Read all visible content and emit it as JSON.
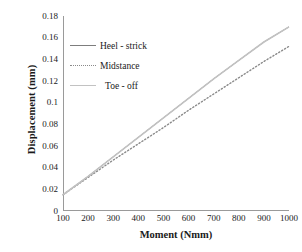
{
  "chart_data": {
    "type": "line",
    "title": "",
    "xlabel": "Moment (Nmm)",
    "ylabel": "Displacement  (mm)",
    "x": [
      100,
      200,
      300,
      400,
      500,
      600,
      700,
      800,
      900,
      1000
    ],
    "xlim": [
      100,
      1000
    ],
    "ylim": [
      0,
      0.18
    ],
    "xticks": [
      "100",
      "200",
      "300",
      "400",
      "500",
      "600",
      "700",
      "800",
      "900",
      "1000"
    ],
    "yticks": [
      "0.18",
      "0.16",
      "0.14",
      "0.12",
      "0.1",
      "0.08",
      "0.06",
      "0.04",
      "0.02",
      "0"
    ],
    "grid": false,
    "legend_position": "upper-left-inside",
    "series": [
      {
        "name": "Heel - strick",
        "style": "solid",
        "color": "#7d7d7d",
        "values": [
          0.015,
          0.032,
          0.05,
          0.068,
          0.086,
          0.104,
          0.122,
          0.139,
          0.156,
          0.17
        ]
      },
      {
        "name": "Midstance",
        "style": "dotted",
        "color": "#8a8a8a",
        "values": [
          0.015,
          0.031,
          0.047,
          0.062,
          0.077,
          0.093,
          0.108,
          0.123,
          0.138,
          0.152
        ]
      },
      {
        "name": "Toe - off",
        "style": "solid-light",
        "color": "#c2c2c2",
        "values": [
          0.015,
          0.032,
          0.05,
          0.068,
          0.086,
          0.104,
          0.122,
          0.139,
          0.156,
          0.17
        ]
      }
    ]
  },
  "legend": {
    "items": [
      {
        "label": "Heel - strick"
      },
      {
        "label": "Midstance"
      },
      {
        "label": "Toe - off"
      }
    ]
  }
}
